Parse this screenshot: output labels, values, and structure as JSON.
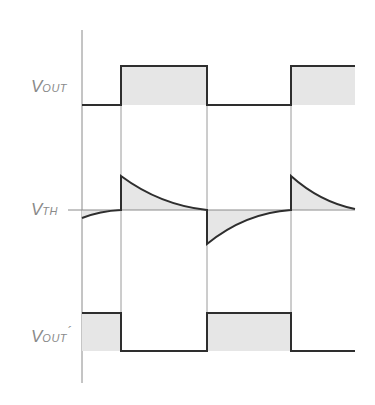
{
  "labels": {
    "vout": {
      "main": "V",
      "sub": "OUT"
    },
    "vth": {
      "main": "V",
      "sub": "TH"
    },
    "vout_prime": {
      "main": "V",
      "sub": "OUT",
      "prime": "´"
    }
  },
  "colors": {
    "trace": "#2e2e2e",
    "guide": "#9a9a9a",
    "fill": "#e6e6e6",
    "label": "#8a8a8a"
  },
  "geometry": {
    "axis_x": 82,
    "axis_top": 30,
    "axis_bottom": 383,
    "transitions_x": [
      121,
      207,
      291
    ],
    "end_x": 355,
    "vout_high_y": 66,
    "vout_low_y": 105,
    "vth_y": 210,
    "vout_prime_high_y": 313,
    "vout_prime_low_y": 351
  }
}
